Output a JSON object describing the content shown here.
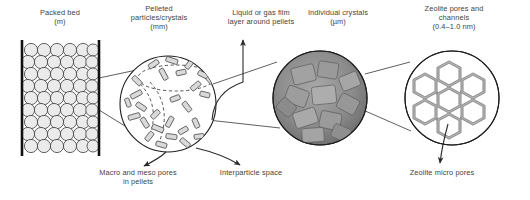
{
  "figure": {
    "type": "multi-scale-schematic",
    "background_color": "#ffffff",
    "text_color": "#3f3f3f",
    "line_color": "#1a1a1a"
  },
  "top_labels": [
    {
      "id": "packed-bed",
      "text": "Packed bed\n(m)",
      "x": 12,
      "y": 8,
      "width": 96
    },
    {
      "id": "pelleted-particles",
      "text": "Pelleted\nparticles/crystals\n(mm)",
      "x": 112,
      "y": 4,
      "width": 94
    },
    {
      "id": "film-layer",
      "text": "Liquid or gas film\nlayer around pellets",
      "x": 212,
      "y": 8,
      "width": 98
    },
    {
      "id": "individual-crystals",
      "text": "Individual crystals\n(µm)",
      "x": 290,
      "y": 8,
      "width": 96
    },
    {
      "id": "zeolite-pores-channels",
      "text": "Zeolite pores and\nchannels\n(0.4–1.0 nm)",
      "x": 399,
      "y": 4,
      "width": 110
    }
  ],
  "bottom_labels": [
    {
      "id": "macro-meso-pores",
      "text": "Macro and meso pores\nin pellets",
      "x": 78,
      "y": 168,
      "width": 120
    },
    {
      "id": "interparticle-space",
      "text": "Interparticle space",
      "x": 205,
      "y": 168,
      "width": 92
    },
    {
      "id": "zeolite-micro-pores",
      "text": "Zeolite micro pores",
      "x": 392,
      "y": 168,
      "width": 100
    }
  ],
  "panels": {
    "packed_bed": {
      "name": "packed-bed-column",
      "wall_left_x": 22,
      "wall_right_x": 98,
      "wall_top_y": 40,
      "wall_bottom_y": 156,
      "sphere_fill": "#ebebeb",
      "sphere_stroke": "#3c3c3c",
      "rows": 8,
      "columns": 6
    },
    "pellet": {
      "name": "pellet-sphere",
      "cx": 168,
      "cy": 104,
      "r": 48,
      "rod_fill": "#d8d8d8",
      "rod_stroke": "#303030"
    },
    "crystals": {
      "name": "crystal-micrograph-circle",
      "cx": 320,
      "cy": 98,
      "r": 47,
      "base_fill": "#8c8c8c"
    },
    "zeolite": {
      "name": "zeolite-framework-circle",
      "cx": 452,
      "cy": 98,
      "r": 47,
      "framework_color": "#8e8e8e"
    }
  }
}
